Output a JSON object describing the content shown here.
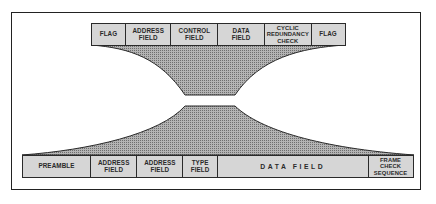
{
  "diagram": {
    "title": "",
    "top_frame": {
      "name": "HDLC frame",
      "fields": [
        {
          "label": "FLAG",
          "width": 34
        },
        {
          "label": "ADDRESS\nFIELD",
          "width": 47
        },
        {
          "label": "CONTROL\nFIELD",
          "width": 47
        },
        {
          "label": "DATA\nFIELD",
          "width": 47
        },
        {
          "label": "CYCLIC\nREDUNDANCY\nCHECK",
          "width": 47
        },
        {
          "label": "FLAG",
          "width": 35
        }
      ]
    },
    "bottom_frame": {
      "name": "Ethernet frame",
      "fields": [
        {
          "label": "PREAMBLE",
          "width": 69
        },
        {
          "label": "ADDRESS\nFIELD",
          "width": 47
        },
        {
          "label": "ADDRESS\nFIELD",
          "width": 47
        },
        {
          "label": "TYPE\nFIELD",
          "width": 36
        },
        {
          "label": "DATA     FIELD",
          "width": 151
        },
        {
          "label": "FRAME\nCHECK\nSEQUENCE",
          "width": 46
        }
      ]
    },
    "connector": "data field of top frame funnels into data field of bottom frame",
    "colors": {
      "box_fill": "#d6d6d6",
      "funnel_fill": "#9a9a9a",
      "line": "#2a2a2a"
    }
  }
}
